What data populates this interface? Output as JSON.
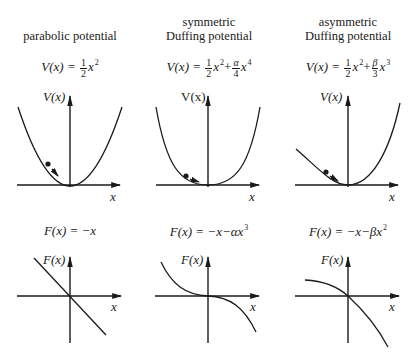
{
  "columns": [
    {
      "title_lines": [
        "parabolic potential"
      ],
      "potential": {
        "lhs": "V(x) =",
        "frac_num": "1",
        "frac_den": "2",
        "term": "x",
        "power": "2"
      },
      "force": {
        "lhs": "F(x) =",
        "rhs": "−x"
      },
      "potential_axis_label": "V(x)",
      "force_axis_label": "F(x)",
      "x_label": "x"
    },
    {
      "title_lines": [
        "symmetric",
        "Duffing potential"
      ],
      "potential": {
        "lhs": "V(x) =",
        "frac_num": "1",
        "frac_den": "2",
        "term": "x",
        "power": "2",
        "plus": "+",
        "frac2_num": "α",
        "frac2_den": "4",
        "term2": "x",
        "power2": "4"
      },
      "force": {
        "lhs": "F(x) =",
        "rhs": "−x−αx",
        "power": "3"
      },
      "potential_axis_label": "V(x)",
      "force_axis_label": "F(x)",
      "x_label": "x"
    },
    {
      "title_lines": [
        "asymmetric",
        "Duffing potential"
      ],
      "potential": {
        "lhs": "V(x) =",
        "frac_num": "1",
        "frac_den": "2",
        "term": "x",
        "power": "2",
        "plus": "+",
        "frac2_num": "β",
        "frac2_den": "3",
        "term2": "x",
        "power2": "3"
      },
      "force": {
        "lhs": "F(x) =",
        "rhs": "−x−βx",
        "power": "2"
      },
      "potential_axis_label": "V(x)",
      "force_axis_label": "F(x)",
      "x_label": "x"
    }
  ],
  "colors": {
    "ink": "#1a1a1a",
    "background": "#ffffff"
  }
}
